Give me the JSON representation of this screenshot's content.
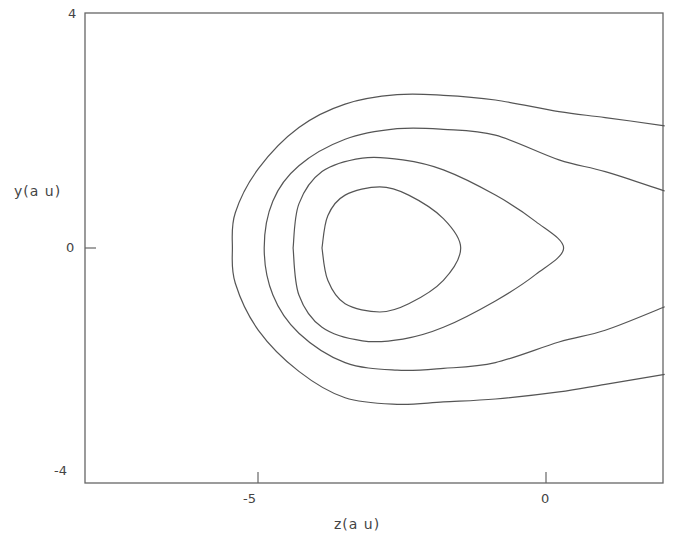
{
  "chart_data": {
    "type": "line",
    "subtype": "contour",
    "title": "",
    "xlabel": "z(a u)",
    "ylabel": "y(a u)",
    "xlim": [
      -8,
      2
    ],
    "ylim": [
      -4,
      4
    ],
    "x_ticks": [
      {
        "value": -5,
        "label": "-5"
      },
      {
        "value": 0,
        "label": "0"
      }
    ],
    "y_ticks": [
      {
        "value": 4,
        "label": "4"
      },
      {
        "value": 0,
        "label": "0"
      },
      {
        "value": -4,
        "label": "-4"
      }
    ],
    "grid": false,
    "legend": null,
    "line_color": "#555555",
    "contours": [
      {
        "name": "contour-1-inner",
        "closed": true,
        "points": [
          [
            -3.9,
            0.0
          ],
          [
            -3.8,
            0.55
          ],
          [
            -3.5,
            0.9
          ],
          [
            -2.9,
            1.04
          ],
          [
            -2.4,
            0.9
          ],
          [
            -1.8,
            0.5
          ],
          [
            -1.5,
            0.0
          ],
          [
            -1.8,
            -0.55
          ],
          [
            -2.4,
            -0.95
          ],
          [
            -2.9,
            -1.09
          ],
          [
            -3.5,
            -0.95
          ],
          [
            -3.8,
            -0.55
          ],
          [
            -3.9,
            0.0
          ]
        ]
      },
      {
        "name": "contour-2",
        "closed": true,
        "points": [
          [
            -4.4,
            0.0
          ],
          [
            -4.3,
            0.75
          ],
          [
            -3.9,
            1.3
          ],
          [
            -3.2,
            1.53
          ],
          [
            -2.5,
            1.5
          ],
          [
            -1.8,
            1.33
          ],
          [
            -0.9,
            0.9
          ],
          [
            -0.2,
            0.45
          ],
          [
            0.28,
            0.0
          ],
          [
            -0.2,
            -0.45
          ],
          [
            -0.9,
            -0.9
          ],
          [
            -1.8,
            -1.35
          ],
          [
            -2.5,
            -1.55
          ],
          [
            -3.2,
            -1.58
          ],
          [
            -3.9,
            -1.35
          ],
          [
            -4.3,
            -0.8
          ],
          [
            -4.4,
            0.0
          ]
        ]
      },
      {
        "name": "contour-3",
        "closed": false,
        "points": [
          [
            2.03,
            0.97
          ],
          [
            1.0,
            1.3
          ],
          [
            0.2,
            1.5
          ],
          [
            -0.9,
            1.92
          ],
          [
            -1.8,
            2.02
          ],
          [
            -2.6,
            2.03
          ],
          [
            -3.5,
            1.85
          ],
          [
            -4.3,
            1.4
          ],
          [
            -4.75,
            0.8
          ],
          [
            -4.9,
            0.0
          ],
          [
            -4.75,
            -0.8
          ],
          [
            -4.3,
            -1.45
          ],
          [
            -3.5,
            -1.95
          ],
          [
            -2.6,
            -2.08
          ],
          [
            -1.8,
            -2.05
          ],
          [
            -0.9,
            -1.95
          ],
          [
            0.2,
            -1.6
          ],
          [
            1.0,
            -1.4
          ],
          [
            2.03,
            -1.0
          ]
        ]
      },
      {
        "name": "contour-4-outer",
        "closed": false,
        "points": [
          [
            2.03,
            2.08
          ],
          [
            1.0,
            2.22
          ],
          [
            0.2,
            2.32
          ],
          [
            -0.9,
            2.52
          ],
          [
            -1.8,
            2.6
          ],
          [
            -2.6,
            2.61
          ],
          [
            -3.5,
            2.45
          ],
          [
            -4.3,
            2.05
          ],
          [
            -5.0,
            1.35
          ],
          [
            -5.4,
            0.6
          ],
          [
            -5.45,
            0.0
          ],
          [
            -5.4,
            -0.6
          ],
          [
            -5.0,
            -1.4
          ],
          [
            -4.3,
            -2.1
          ],
          [
            -3.5,
            -2.55
          ],
          [
            -2.6,
            -2.66
          ],
          [
            -1.8,
            -2.62
          ],
          [
            -0.9,
            -2.57
          ],
          [
            0.2,
            -2.45
          ],
          [
            1.0,
            -2.32
          ],
          [
            2.03,
            -2.15
          ]
        ]
      }
    ]
  },
  "axes": {
    "ylabel": "y(a u)",
    "xlabel": "z(a u)",
    "y_tick_top": "4",
    "y_tick_mid": "0",
    "y_tick_bottom": "-4",
    "x_tick_left": "-5",
    "x_tick_right": "0"
  }
}
